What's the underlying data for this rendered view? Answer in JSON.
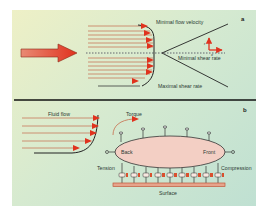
{
  "panel_a": {
    "letter": "a",
    "labels": {
      "min_velocity": "Minimal flow velocity",
      "min_shear": "Minimal shear rate",
      "max_shear": "Maximal shear rate",
      "axis_r": "r",
      "axis_x": "x"
    }
  },
  "panel_b": {
    "letter": "b",
    "labels": {
      "fluid_flow": "Fluid flow",
      "torque": "Torque",
      "back": "Back",
      "front": "Front",
      "tension": "Tension",
      "compression": "Compression",
      "surface": "Surface"
    }
  },
  "colors": {
    "flow_red": "#e0321e",
    "line_red": "#c87a5a",
    "cell_fill": "#f3cfc4",
    "surface_red": "#d96f4e",
    "divider": "#111111"
  }
}
